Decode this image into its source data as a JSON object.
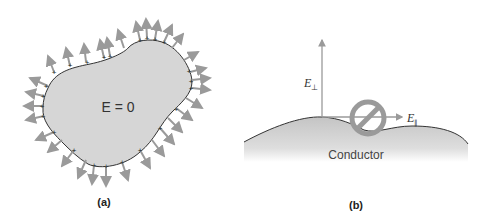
{
  "panel_a": {
    "caption": "(a)",
    "field_label": "E = 0",
    "surface_charge_symbol": "+",
    "fill_color": "#d6d6d6",
    "arrow_color": "#9a9a9a"
  },
  "panel_b": {
    "caption": "(b)",
    "conductor_label": "Conductor",
    "perp_label": "E",
    "perp_sub": "⊥",
    "par_label": "E",
    "par_sub": "∥",
    "prohibit_color": "#9a9a9a",
    "fill_color": "#cfcfcf"
  }
}
